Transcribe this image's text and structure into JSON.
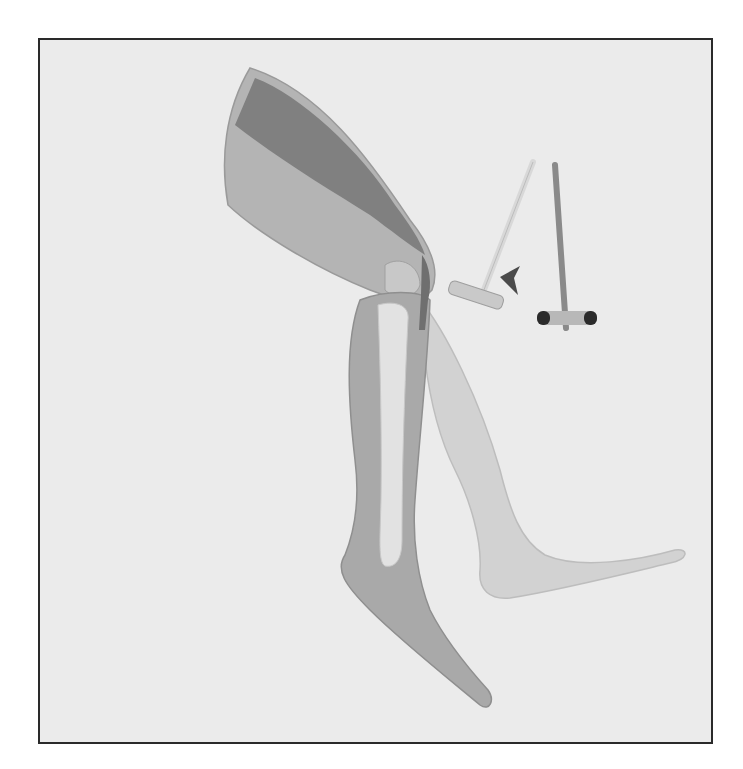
{
  "diagram": {
    "labels": {
      "muscle": "Muskel",
      "patella_line1": "Kniescheibe",
      "patella_line2": "(Patella)",
      "tendon": "Patellarsehne"
    },
    "icons": {
      "hammer_strike_arrow": "arrow-left-dashed",
      "leg_kick_arrow": "arrow-right-dashed"
    },
    "colors": {
      "background": "#ebebeb",
      "frame": "#2a2a2a",
      "skin_front": "#a9a9a9",
      "skin_back": "#d2d2d2",
      "muscle": "#7a7a7a",
      "bone": "#e2e2e2",
      "arrow": "#4a4a4a",
      "leader_line": "#111111"
    }
  }
}
